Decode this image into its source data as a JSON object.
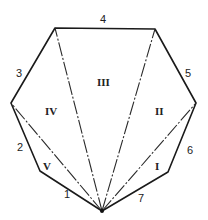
{
  "diagram": {
    "type": "heptagon-triangulation",
    "vertices": {
      "A": [
        102,
        211
      ],
      "B": [
        40,
        171
      ],
      "C": [
        11,
        103
      ],
      "D": [
        55,
        28
      ],
      "E": [
        155,
        29
      ],
      "F": [
        196,
        103
      ],
      "G": [
        168,
        172
      ]
    },
    "edge_labels": [
      {
        "id": "1",
        "text": "1",
        "x": 64,
        "y": 198
      },
      {
        "id": "2",
        "text": "2",
        "x": 17,
        "y": 151
      },
      {
        "id": "3",
        "text": "3",
        "x": 18,
        "y": 76
      },
      {
        "id": "4",
        "text": "4",
        "x": 100,
        "y": 24
      },
      {
        "id": "5",
        "text": "5",
        "x": 184,
        "y": 77
      },
      {
        "id": "6",
        "text": "6",
        "x": 186,
        "y": 153
      },
      {
        "id": "7",
        "text": "7",
        "x": 138,
        "y": 200
      }
    ],
    "region_labels": [
      {
        "id": "I",
        "text": "I",
        "x": 157,
        "y": 169
      },
      {
        "id": "II",
        "text": "II",
        "x": 159,
        "y": 114
      },
      {
        "id": "III",
        "text": "III",
        "x": 103,
        "y": 85
      },
      {
        "id": "IV",
        "text": "IV",
        "x": 52,
        "y": 114
      },
      {
        "id": "V",
        "text": "V",
        "x": 47,
        "y": 168
      }
    ]
  }
}
